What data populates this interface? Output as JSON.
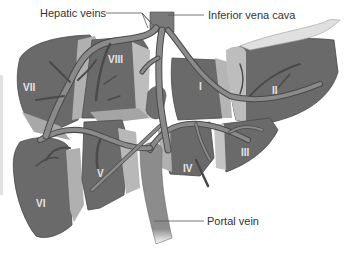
{
  "figure": {
    "callouts": {
      "hepatic_veins": "Hepatic veins",
      "inferior_vena_cava": "Inferior vena cava",
      "portal_vein": "Portal vein"
    },
    "segments": {
      "I": "I",
      "II": "II",
      "III": "III",
      "IV": "IV",
      "V": "V",
      "VI": "VI",
      "VII": "VII",
      "VIII": "VIII"
    },
    "colors": {
      "segment_fill": "#6a6a6a",
      "segment_light_face": "#b5b5b5",
      "vessel_fill": "#8a8a8a",
      "vessel_outline": "#4a4a4a",
      "label_text": "#333333",
      "segment_label_text": "#e6e6e6"
    }
  }
}
